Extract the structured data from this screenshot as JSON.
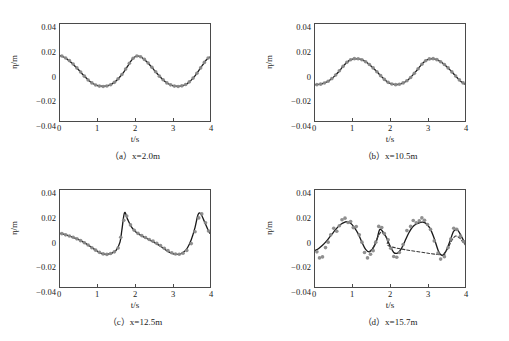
{
  "figure": {
    "background": "#ffffff",
    "curve_color": "#1a1a1a",
    "marker_color": "#8a8a8a",
    "axis_color": "#4a4a4a"
  },
  "axes": {
    "xlabel": "t/s",
    "ylabel": "η/m",
    "xticks": [
      "0",
      "1",
      "2",
      "3",
      "4"
    ],
    "yticks": [
      "0.04",
      "0.02",
      "0",
      "−0.02",
      "−0.04"
    ],
    "xlim": [
      0,
      4
    ],
    "ylim": [
      -0.04,
      0.04
    ],
    "grid": false
  },
  "panels": [
    {
      "id": "a",
      "caption": "（a）x=2.0m",
      "label": "(a)",
      "location": "x=2.0m"
    },
    {
      "id": "b",
      "caption": "（b）x=10.5m",
      "label": "(b)",
      "location": "x=10.5m"
    },
    {
      "id": "c",
      "caption": "（c）x=12.5m",
      "label": "(c)",
      "location": "x=12.5m"
    },
    {
      "id": "d",
      "caption": "（d）x=15.7m",
      "label": "(d)",
      "location": "x=15.7m"
    }
  ],
  "chart_data": [
    {
      "type": "line",
      "panel": "a",
      "title": "（a）x=2.0m",
      "xlabel": "t/s",
      "ylabel": "η/m",
      "xlim": [
        0,
        4
      ],
      "ylim": [
        -0.04,
        0.04
      ],
      "xticks": [
        0,
        1,
        2,
        3,
        4
      ],
      "yticks": [
        0.04,
        0.02,
        0,
        -0.02,
        -0.04
      ],
      "grid": false,
      "series": [
        {
          "name": "computed",
          "style": "solid-line",
          "color": "#1a1a1a",
          "x": [
            0.0,
            0.1,
            0.2,
            0.3,
            0.4,
            0.5,
            0.6,
            0.7,
            0.8,
            0.9,
            1.0,
            1.1,
            1.2,
            1.3,
            1.4,
            1.5,
            1.6,
            1.7,
            1.8,
            1.9,
            2.0,
            2.1,
            2.2,
            2.3,
            2.4,
            2.5,
            2.6,
            2.7,
            2.8,
            2.9,
            3.0,
            3.1,
            3.2,
            3.3,
            3.4,
            3.5,
            3.6,
            3.7,
            3.8,
            3.9,
            4.0
          ],
          "y": [
            0.014,
            0.0128,
            0.0108,
            0.0082,
            0.0052,
            0.002,
            -0.0014,
            -0.0046,
            -0.0074,
            -0.0095,
            -0.0108,
            -0.0113,
            -0.0113,
            -0.0107,
            -0.0092,
            -0.0068,
            -0.0035,
            0.0003,
            0.005,
            0.0098,
            0.013,
            0.0135,
            0.012,
            0.0093,
            0.006,
            0.0024,
            -0.0012,
            -0.0046,
            -0.0074,
            -0.0095,
            -0.0108,
            -0.0113,
            -0.0113,
            -0.0106,
            -0.009,
            -0.0063,
            -0.0028,
            0.0015,
            0.006,
            0.0103,
            0.0128
          ]
        },
        {
          "name": "measured",
          "style": "markers",
          "color": "#8a8a8a",
          "x": [
            0.05,
            0.15,
            0.25,
            0.35,
            0.45,
            0.55,
            0.65,
            0.75,
            0.85,
            0.95,
            1.05,
            1.15,
            1.25,
            1.35,
            1.45,
            1.55,
            1.65,
            1.75,
            1.85,
            1.95,
            2.05,
            2.15,
            2.25,
            2.35,
            2.45,
            2.55,
            2.65,
            2.75,
            2.85,
            2.95,
            3.05,
            3.15,
            3.25,
            3.35,
            3.45,
            3.55,
            3.65,
            3.75,
            3.85,
            3.95
          ],
          "y": [
            0.0136,
            0.012,
            0.0098,
            0.007,
            0.0038,
            0.0004,
            -0.003,
            -0.0062,
            -0.0086,
            -0.0103,
            -0.0112,
            -0.0116,
            -0.0111,
            -0.0101,
            -0.0081,
            -0.0052,
            -0.0016,
            0.0028,
            0.0076,
            0.0118,
            0.0136,
            0.013,
            0.0108,
            0.0078,
            0.0043,
            0.0006,
            -0.003,
            -0.006,
            -0.0086,
            -0.0102,
            -0.0112,
            -0.0115,
            -0.011,
            -0.0099,
            -0.0077,
            -0.0046,
            -0.0006,
            0.0038,
            0.0083,
            0.012
          ]
        }
      ]
    },
    {
      "type": "line",
      "panel": "b",
      "title": "（b）x=10.5m",
      "xlabel": "t/s",
      "ylabel": "η/m",
      "xlim": [
        0,
        4
      ],
      "ylim": [
        -0.04,
        0.04
      ],
      "xticks": [
        0,
        1,
        2,
        3,
        4
      ],
      "yticks": [
        0.04,
        0.02,
        0,
        -0.02,
        -0.04
      ],
      "grid": false,
      "series": [
        {
          "name": "computed",
          "style": "solid-line",
          "color": "#1a1a1a",
          "x": [
            0.0,
            0.1,
            0.2,
            0.3,
            0.4,
            0.5,
            0.6,
            0.7,
            0.8,
            0.9,
            1.0,
            1.1,
            1.2,
            1.3,
            1.4,
            1.5,
            1.6,
            1.7,
            1.8,
            1.9,
            2.0,
            2.1,
            2.2,
            2.3,
            2.4,
            2.5,
            2.6,
            2.7,
            2.8,
            2.9,
            3.0,
            3.1,
            3.2,
            3.3,
            3.4,
            3.5,
            3.6,
            3.7,
            3.8,
            3.9,
            4.0
          ],
          "y": [
            -0.01,
            -0.0098,
            -0.0092,
            -0.008,
            -0.0062,
            -0.0036,
            -0.0004,
            0.0032,
            0.0068,
            0.0096,
            0.011,
            0.0113,
            0.011,
            0.0098,
            0.0078,
            0.0052,
            0.0022,
            -0.001,
            -0.0042,
            -0.007,
            -0.0089,
            -0.0098,
            -0.0099,
            -0.0092,
            -0.0078,
            -0.0055,
            -0.0024,
            0.0012,
            0.005,
            0.0084,
            0.0106,
            0.0113,
            0.011,
            0.0098,
            0.0078,
            0.0052,
            0.0022,
            -0.0012,
            -0.0046,
            -0.0076,
            -0.0096
          ]
        },
        {
          "name": "measured",
          "style": "markers",
          "color": "#8a8a8a",
          "x": [
            0.05,
            0.15,
            0.25,
            0.35,
            0.45,
            0.55,
            0.65,
            0.75,
            0.85,
            0.95,
            1.05,
            1.15,
            1.25,
            1.35,
            1.45,
            1.55,
            1.65,
            1.75,
            1.85,
            1.95,
            2.05,
            2.15,
            2.25,
            2.35,
            2.45,
            2.55,
            2.65,
            2.75,
            2.85,
            2.95,
            3.05,
            3.15,
            3.25,
            3.35,
            3.45,
            3.55,
            3.65,
            3.75,
            3.85,
            3.95
          ],
          "y": [
            -0.01,
            -0.0096,
            -0.0087,
            -0.0072,
            -0.005,
            -0.0021,
            0.0014,
            0.0051,
            0.0084,
            0.0105,
            0.0114,
            0.0113,
            0.0105,
            0.0089,
            0.0066,
            0.0038,
            0.0006,
            -0.0026,
            -0.0057,
            -0.0081,
            -0.0095,
            -0.01,
            -0.0097,
            -0.0086,
            -0.0068,
            -0.0041,
            -0.0007,
            0.0031,
            0.0068,
            0.0097,
            0.0112,
            0.0114,
            0.0106,
            0.0089,
            0.0066,
            0.0038,
            0.0005,
            -0.0029,
            -0.0061,
            -0.0086
          ]
        }
      ]
    },
    {
      "type": "line",
      "panel": "c",
      "title": "（c）x=12.5m",
      "xlabel": "t/s",
      "ylabel": "η/m",
      "xlim": [
        0,
        4
      ],
      "ylim": [
        -0.04,
        0.04
      ],
      "xticks": [
        0,
        1,
        2,
        3,
        4
      ],
      "yticks": [
        0.04,
        0.02,
        0,
        -0.02,
        -0.04
      ],
      "grid": false,
      "series": [
        {
          "name": "computed",
          "style": "solid-line",
          "color": "#1a1a1a",
          "x": [
            0.0,
            0.1,
            0.2,
            0.3,
            0.4,
            0.5,
            0.6,
            0.7,
            0.8,
            0.9,
            1.0,
            1.1,
            1.2,
            1.3,
            1.4,
            1.5,
            1.6,
            1.65,
            1.72,
            1.8,
            1.9,
            2.0,
            2.1,
            2.2,
            2.3,
            2.4,
            2.5,
            2.6,
            2.7,
            2.8,
            2.9,
            3.0,
            3.1,
            3.2,
            3.3,
            3.4,
            3.5,
            3.6,
            3.68,
            3.75,
            3.85,
            3.95,
            4.0
          ],
          "y": [
            0.0042,
            0.0035,
            0.0026,
            0.0016,
            0.0004,
            -0.001,
            -0.0026,
            -0.0044,
            -0.0064,
            -0.0086,
            -0.0105,
            -0.0122,
            -0.013,
            -0.0128,
            -0.0118,
            -0.0095,
            -0.003,
            0.007,
            0.0212,
            0.016,
            0.0098,
            0.006,
            0.0036,
            0.0018,
            0.0002,
            -0.0014,
            -0.003,
            -0.0048,
            -0.0068,
            -0.009,
            -0.011,
            -0.0124,
            -0.013,
            -0.0128,
            -0.0112,
            -0.0076,
            -0.001,
            0.009,
            0.0195,
            0.0205,
            0.014,
            0.007,
            0.0042
          ]
        },
        {
          "name": "measured",
          "style": "markers",
          "color": "#8a8a8a",
          "x": [
            0.05,
            0.15,
            0.25,
            0.35,
            0.45,
            0.55,
            0.65,
            0.75,
            0.85,
            0.95,
            1.05,
            1.15,
            1.25,
            1.35,
            1.45,
            1.55,
            1.62,
            1.7,
            1.78,
            1.88,
            1.98,
            2.08,
            2.18,
            2.28,
            2.38,
            2.48,
            2.58,
            2.68,
            2.78,
            2.88,
            2.98,
            3.08,
            3.18,
            3.28,
            3.38,
            3.5,
            3.6,
            3.7,
            3.78,
            3.88,
            3.96
          ],
          "y": [
            0.004,
            0.003,
            0.0021,
            0.001,
            -0.0003,
            -0.0018,
            -0.0035,
            -0.0054,
            -0.0076,
            -0.0096,
            -0.0114,
            -0.0127,
            -0.0131,
            -0.0124,
            -0.011,
            -0.0078,
            0.001,
            0.015,
            0.0186,
            0.0112,
            0.0068,
            0.0042,
            0.0024,
            0.0008,
            -0.0008,
            -0.0022,
            -0.004,
            -0.0058,
            -0.008,
            -0.01,
            -0.0118,
            -0.0128,
            -0.013,
            -0.0122,
            -0.0098,
            -0.0042,
            0.0056,
            0.017,
            0.0203,
            0.013,
            0.0062
          ]
        }
      ]
    },
    {
      "type": "line",
      "panel": "d",
      "title": "（d）x=15.7m",
      "xlabel": "t/s",
      "ylabel": "η/m",
      "xlim": [
        0,
        4
      ],
      "ylim": [
        -0.04,
        0.04
      ],
      "xticks": [
        0,
        1,
        2,
        3,
        4
      ],
      "yticks": [
        0.04,
        0.02,
        0,
        -0.02,
        -0.04
      ],
      "grid": false,
      "series": [
        {
          "name": "computed",
          "style": "solid-line",
          "color": "#1a1a1a",
          "x": [
            0.0,
            0.1,
            0.2,
            0.3,
            0.4,
            0.5,
            0.6,
            0.7,
            0.8,
            0.85,
            0.95,
            1.05,
            1.15,
            1.25,
            1.35,
            1.45,
            1.55,
            1.65,
            1.72,
            1.8,
            1.9,
            2.0,
            2.1,
            2.2,
            2.3,
            2.4,
            2.5,
            2.6,
            2.7,
            2.8,
            2.88,
            2.98,
            3.08,
            3.18,
            3.3,
            3.4,
            3.5,
            3.6,
            3.7,
            3.8,
            3.9,
            4.0
          ],
          "y": [
            -0.01,
            -0.0082,
            -0.0056,
            -0.0024,
            0.0015,
            0.0055,
            0.0092,
            0.012,
            0.0135,
            0.0138,
            0.0125,
            0.009,
            0.004,
            -0.003,
            -0.009,
            -0.011,
            -0.008,
            -0.001,
            0.0072,
            0.006,
            0.001,
            -0.006,
            -0.0115,
            -0.012,
            -0.0085,
            -0.002,
            0.0045,
            0.0095,
            0.012,
            0.0132,
            0.0135,
            0.012,
            0.0075,
            0.0,
            -0.011,
            -0.014,
            -0.01,
            -0.002,
            0.006,
            0.007,
            0.002,
            -0.004
          ]
        },
        {
          "name": "computed-alt",
          "style": "dashed-line",
          "color": "#3a3a3a",
          "x": [
            1.45,
            1.55,
            1.65,
            1.75,
            1.85,
            1.95,
            2.05,
            3.35,
            3.45,
            3.55,
            3.65,
            3.75,
            3.85,
            3.95,
            4.0
          ],
          "y": [
            -0.0108,
            -0.0075,
            -0.0005,
            0.005,
            0.003,
            -0.0015,
            -0.007,
            -0.0135,
            -0.012,
            -0.0075,
            -0.0015,
            0.002,
            0.0005,
            -0.003,
            -0.005
          ]
        },
        {
          "name": "measured",
          "style": "markers",
          "color": "#8a8a8a",
          "x": [
            0.05,
            0.12,
            0.2,
            0.28,
            0.35,
            0.42,
            0.5,
            0.58,
            0.65,
            0.72,
            0.8,
            0.88,
            0.95,
            1.02,
            1.1,
            1.18,
            1.25,
            1.32,
            1.4,
            1.48,
            1.55,
            1.62,
            1.7,
            1.78,
            1.85,
            1.95,
            2.02,
            2.1,
            2.18,
            2.25,
            2.35,
            2.45,
            2.55,
            2.62,
            2.7,
            2.78,
            2.85,
            2.92,
            3.0,
            3.08,
            3.18,
            3.28,
            3.35,
            3.45,
            3.55,
            3.62,
            3.7,
            3.78,
            3.88,
            3.96
          ],
          "y": [
            -0.011,
            -0.016,
            -0.0152,
            -0.0075,
            -0.003,
            0.003,
            0.0085,
            0.006,
            0.0105,
            0.0155,
            0.0168,
            0.0132,
            0.014,
            0.009,
            0.0098,
            0.003,
            -0.003,
            -0.0115,
            -0.016,
            -0.013,
            -0.01,
            -0.003,
            0.01,
            0.009,
            0.004,
            -0.001,
            -0.008,
            -0.0148,
            -0.0155,
            -0.0115,
            -0.005,
            0.0065,
            0.01,
            0.0148,
            0.013,
            0.0145,
            0.017,
            0.015,
            0.0115,
            0.0075,
            -0.002,
            -0.012,
            -0.017,
            -0.015,
            -0.0075,
            -0.0005,
            0.0085,
            0.0075,
            0.002,
            -0.0025
          ]
        }
      ]
    }
  ]
}
